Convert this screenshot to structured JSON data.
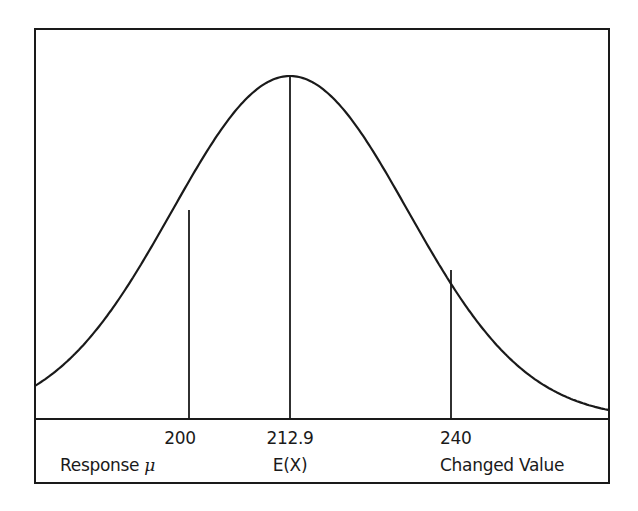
{
  "chart_data": {
    "type": "line",
    "title": "",
    "subtitle": "",
    "xlabel": "",
    "ylabel": "",
    "distribution": {
      "kind": "normal",
      "mean": 212.9
    },
    "grid": false,
    "legend": null,
    "reference_lines": [
      {
        "x": 200,
        "value_label": "200",
        "name_label": "Response",
        "name_symbol": "μ",
        "relative_height": 0.65
      },
      {
        "x": 212.9,
        "value_label": "212.9",
        "name_label": "E(X)",
        "name_symbol": "",
        "relative_height": 1.0
      },
      {
        "x": 240,
        "value_label": "240",
        "name_label": "Changed Value",
        "name_symbol": "",
        "relative_height": 0.46
      }
    ],
    "x_axis": {
      "ticks": [
        "200",
        "212.9",
        "240"
      ]
    }
  },
  "labels": {
    "tick_200": "200",
    "tick_2129": "212.9",
    "tick_240": "240",
    "name_200": "Response ",
    "name_200_symbol": "μ",
    "name_2129": "E(X)",
    "name_240": "Changed Value"
  },
  "colors": {
    "line": "#1a1a1a",
    "background": "#ffffff"
  }
}
